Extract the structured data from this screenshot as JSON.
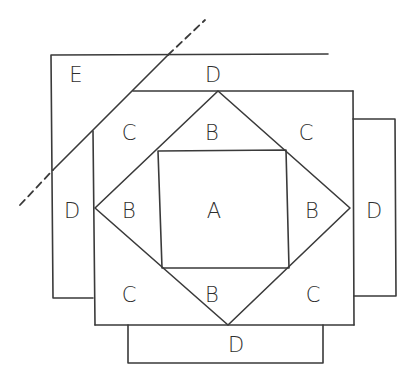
{
  "diagram": {
    "type": "quilt-block-piecing",
    "line_color": "#3a3a3a",
    "labels": {
      "E": {
        "text": "E",
        "x": 76,
        "y": 82
      },
      "D_top": {
        "text": "D",
        "x": 213,
        "y": 82
      },
      "C_top_left": {
        "text": "C",
        "x": 129,
        "y": 140
      },
      "B_top": {
        "text": "B",
        "x": 212,
        "y": 140
      },
      "C_top_right": {
        "text": "C",
        "x": 306,
        "y": 140
      },
      "D_left": {
        "text": "D",
        "x": 72,
        "y": 218
      },
      "B_left": {
        "text": "B",
        "x": 129,
        "y": 218
      },
      "A": {
        "text": "A",
        "x": 214,
        "y": 218
      },
      "B_right": {
        "text": "B",
        "x": 312,
        "y": 218
      },
      "D_right": {
        "text": "D",
        "x": 374,
        "y": 218
      },
      "C_bottom_left": {
        "text": "C",
        "x": 129,
        "y": 302
      },
      "B_bottom": {
        "text": "B",
        "x": 212,
        "y": 302
      },
      "C_bottom_right": {
        "text": "C",
        "x": 313,
        "y": 302
      },
      "D_bottom": {
        "text": "D",
        "x": 236,
        "y": 352
      }
    }
  }
}
